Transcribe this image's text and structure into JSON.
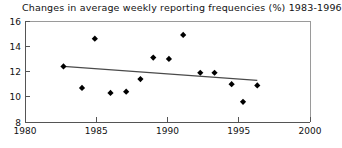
{
  "chart_data": {
    "type": "scatter",
    "title": "Changes in average weekly reporting frequencies (%) 1983-1996",
    "xlabel": "",
    "ylabel": "",
    "xlim": [
      1980,
      2000
    ],
    "ylim": [
      8,
      16
    ],
    "xticks": [
      1980,
      1985,
      1990,
      1995,
      2000
    ],
    "xtick_labels": [
      "1980",
      "1985",
      "1990",
      "1995",
      "2000"
    ],
    "yticks": [
      8,
      10,
      12,
      14,
      16
    ],
    "ytick_labels": [
      "8",
      "10",
      "12",
      "14",
      "16"
    ],
    "grid": false,
    "legend": false,
    "marker": "diamond",
    "marker_color": "#000000",
    "series": [
      {
        "name": "Average weekly reporting frequency",
        "x": [
          1982.7,
          1984.0,
          1984.9,
          1986.0,
          1987.1,
          1988.1,
          1989.0,
          1990.1,
          1991.1,
          1992.3,
          1993.3,
          1994.5,
          1995.3,
          1996.3
        ],
        "values": [
          12.4,
          10.7,
          14.6,
          10.3,
          10.4,
          11.4,
          13.1,
          13.0,
          14.9,
          11.9,
          11.9,
          11.0,
          9.6,
          10.9
        ]
      }
    ],
    "trendline": {
      "name": "linear-trend",
      "x": [
        1982.7,
        1996.3
      ],
      "values": [
        12.4,
        11.3
      ],
      "color": "#4a4a4a"
    }
  }
}
